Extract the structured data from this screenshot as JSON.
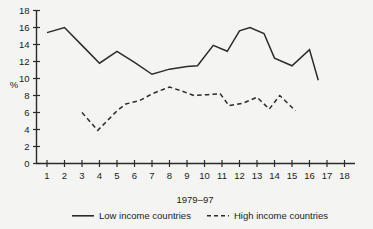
{
  "chart_data": {
    "type": "line",
    "title": "",
    "xlabel": "1979–97",
    "ylabel": "%",
    "xlim": [
      0.4,
      18.6
    ],
    "ylim": [
      0,
      18
    ],
    "yticks": [
      0,
      2,
      4,
      6,
      8,
      10,
      12,
      14,
      16,
      18
    ],
    "xticks": [
      1,
      2,
      3,
      4,
      5,
      6,
      7,
      8,
      9,
      10,
      11,
      12,
      13,
      14,
      15,
      16,
      17,
      18
    ],
    "grid": false,
    "legend_position": "below",
    "series": [
      {
        "name": "Low income countries",
        "style": "solid",
        "color": "#2b2b2b",
        "x": [
          1.0,
          2.0,
          3.0,
          4.0,
          5.0,
          6.0,
          7.0,
          8.0,
          9.0,
          9.6,
          10.5,
          11.3,
          12.0,
          12.6,
          13.4,
          14.0,
          15.0,
          16.0,
          16.5
        ],
        "values": [
          15.4,
          16.0,
          13.9,
          11.8,
          13.2,
          11.9,
          10.5,
          11.1,
          11.4,
          11.5,
          13.9,
          13.2,
          15.6,
          16.0,
          15.3,
          12.4,
          11.5,
          13.4,
          9.8
        ]
      },
      {
        "name": "High income countries",
        "style": "dashed",
        "color": "#2b2b2b",
        "x": [
          3.0,
          3.9,
          5.0,
          5.5,
          6.3,
          7.0,
          8.0,
          8.6,
          9.4,
          10.2,
          10.9,
          11.4,
          12.2,
          13.0,
          13.7,
          14.3,
          15.2
        ],
        "values": [
          6.0,
          3.9,
          6.2,
          7.0,
          7.4,
          8.2,
          9.0,
          8.6,
          8.0,
          8.1,
          8.2,
          6.8,
          7.1,
          7.8,
          6.4,
          8.0,
          6.2
        ]
      }
    ]
  },
  "axes": {
    "y_axis_label": "%",
    "x_axis_label": "1979–97",
    "y_tick_labels": [
      "0",
      "2",
      "4",
      "6",
      "8",
      "10",
      "12",
      "14",
      "16",
      "18"
    ],
    "x_tick_labels": [
      "1",
      "2",
      "3",
      "4",
      "5",
      "6",
      "7",
      "8",
      "9",
      "10",
      "11",
      "12",
      "13",
      "14",
      "15",
      "16",
      "17",
      "18"
    ]
  },
  "legend": {
    "items": [
      {
        "label": "Low income countries",
        "style": "solid"
      },
      {
        "label": "High income countries",
        "style": "dashed"
      }
    ]
  },
  "colors": {
    "background": "#f4f4f2",
    "ink": "#2b2b2b"
  }
}
